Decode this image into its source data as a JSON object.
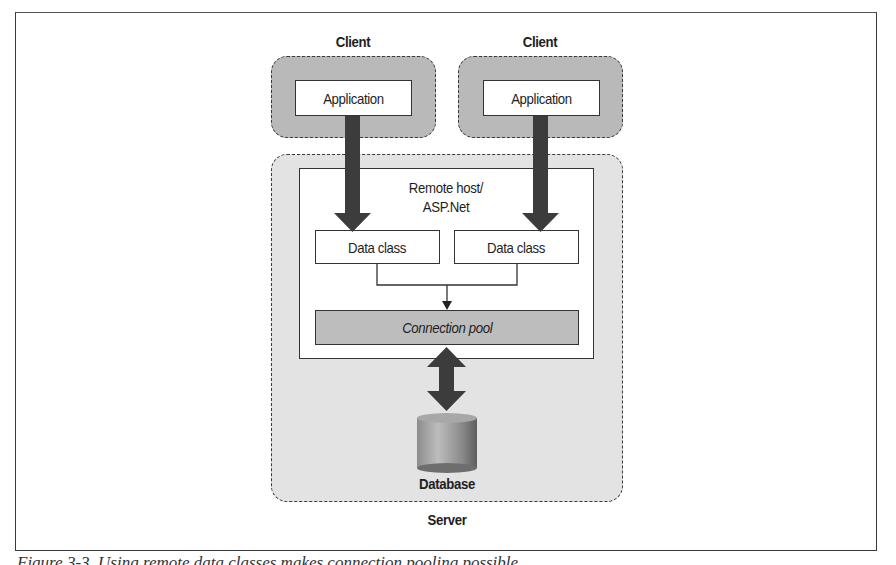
{
  "figure": {
    "clients": [
      {
        "title": "Client",
        "component": "Application"
      },
      {
        "title": "Client",
        "component": "Application"
      }
    ],
    "server": {
      "title": "Server",
      "host": {
        "title_line1": "Remote host/",
        "title_line2": "ASP.Net",
        "data_classes": [
          "Data class",
          "Data class"
        ],
        "connection_pool": "Connection pool"
      },
      "database": "Database"
    },
    "caption": "Figure 3-3. Using remote data classes makes connection pooling possible"
  },
  "colors": {
    "client_fill": "#b9b9b9",
    "server_fill": "#e3e3e3",
    "pool_fill": "#bdbdbd",
    "arrow": "#3c3c3c",
    "stroke": "#333333"
  }
}
